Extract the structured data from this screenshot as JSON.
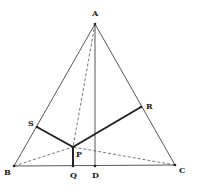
{
  "diagram": {
    "type": "geometry",
    "title": "",
    "points": {
      "A": {
        "label": "A",
        "x": 95,
        "y": 24
      },
      "B": {
        "label": "B",
        "x": 14,
        "y": 166
      },
      "C": {
        "label": "C",
        "x": 175,
        "y": 165
      },
      "D": {
        "label": "D",
        "x": 95,
        "y": 166
      },
      "Q": {
        "label": "Q",
        "x": 73,
        "y": 166
      },
      "P": {
        "label": "P",
        "x": 73,
        "y": 147
      },
      "S": {
        "label": "S",
        "x": 37,
        "y": 127
      },
      "R": {
        "label": "R",
        "x": 141,
        "y": 107
      }
    },
    "segments": [
      {
        "from": "A",
        "to": "B",
        "style": "solid"
      },
      {
        "from": "A",
        "to": "C",
        "style": "solid"
      },
      {
        "from": "B",
        "to": "C",
        "style": "solid"
      },
      {
        "from": "A",
        "to": "D",
        "style": "solid"
      },
      {
        "from": "P",
        "to": "S",
        "style": "thick"
      },
      {
        "from": "P",
        "to": "R",
        "style": "thick"
      },
      {
        "from": "P",
        "to": "Q",
        "style": "thick"
      },
      {
        "from": "A",
        "to": "P",
        "style": "dashed"
      },
      {
        "from": "B",
        "to": "P",
        "style": "dashed"
      },
      {
        "from": "C",
        "to": "P",
        "style": "dashed"
      }
    ],
    "colors": {
      "line": "#444444",
      "thick": "#222222",
      "background": "#ffffff"
    }
  }
}
